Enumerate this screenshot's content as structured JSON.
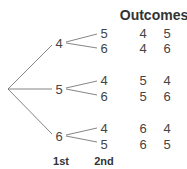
{
  "header": "Outcomes",
  "first_level": [
    {
      "value": "4",
      "second": [
        "5",
        "6"
      ],
      "outcomes": [
        [
          "4",
          "5"
        ],
        [
          "4",
          "6"
        ]
      ]
    },
    {
      "value": "5",
      "second": [
        "4",
        "6"
      ],
      "outcomes": [
        [
          "5",
          "4"
        ],
        [
          "5",
          "6"
        ]
      ]
    },
    {
      "value": "6",
      "second": [
        "4",
        "5"
      ],
      "outcomes": [
        [
          "6",
          "4"
        ],
        [
          "6",
          "5"
        ]
      ]
    }
  ],
  "labels": {
    "first": "1st",
    "second": "2nd"
  }
}
